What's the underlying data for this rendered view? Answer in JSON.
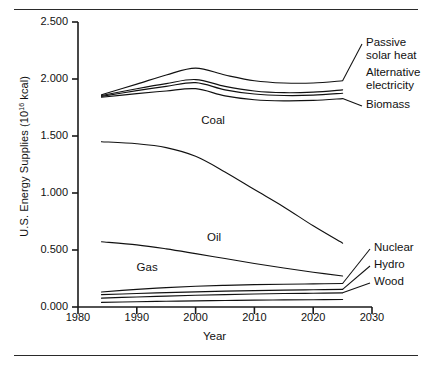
{
  "figure": {
    "has_top_rule": true,
    "has_bottom_rule": true
  },
  "chart_data": {
    "type": "line",
    "title": "",
    "xlabel": "Year",
    "ylabel": "U.S. Energy Supplies (10",
    "ylabel_exponent": "16",
    "ylabel_suffix": " kcal)",
    "xlim": [
      1980,
      2030
    ],
    "ylim": [
      0.0,
      2.5
    ],
    "grid": false,
    "legend_position": "inline-annotations",
    "x_ticks": [
      "1980",
      "1990",
      "2000",
      "2010",
      "2020",
      "2030"
    ],
    "x_tick_values": [
      1980,
      1990,
      2000,
      2010,
      2020,
      2030
    ],
    "y_ticks": [
      "0.000",
      "0.500",
      "1.000",
      "1.500",
      "2.000",
      "2.500"
    ],
    "y_tick_values": [
      0.0,
      0.5,
      1.0,
      1.5,
      2.0,
      2.5
    ],
    "x": [
      1984,
      1990,
      1995,
      2000,
      2005,
      2010,
      2015,
      2020,
      2025
    ],
    "series": [
      {
        "name": "Passive solar heat",
        "label": "Passive",
        "label_line2": "solar heat",
        "label_type": "leader",
        "values": [
          1.862,
          1.955,
          2.035,
          2.095,
          2.035,
          1.985,
          1.965,
          1.965,
          1.985
        ]
      },
      {
        "name": "Alternative electricity",
        "label": "Alternative",
        "label_line2": "electricity",
        "label_type": "leader",
        "values": [
          1.855,
          1.915,
          1.96,
          1.995,
          1.935,
          1.895,
          1.88,
          1.885,
          1.905
        ]
      },
      {
        "name": "Alternative electricity lower bound",
        "label": "",
        "label_type": "none",
        "values": [
          1.848,
          1.898,
          1.935,
          1.968,
          1.905,
          1.868,
          1.855,
          1.858,
          1.875
        ]
      },
      {
        "name": "Biomass",
        "label": "Biomass",
        "label_type": "leader",
        "values": [
          1.84,
          1.872,
          1.895,
          1.915,
          1.852,
          1.818,
          1.808,
          1.812,
          1.828
        ]
      },
      {
        "name": "Coal",
        "label": "Coal",
        "label_type": "inline",
        "values": [
          1.45,
          1.432,
          1.398,
          1.322,
          1.185,
          1.03,
          0.878,
          0.712,
          0.56
        ]
      },
      {
        "name": "Oil",
        "label": "Oil",
        "label_type": "inline",
        "values": [
          0.572,
          0.545,
          0.51,
          0.468,
          0.425,
          0.382,
          0.342,
          0.305,
          0.272
        ]
      },
      {
        "name": "Nuclear",
        "label": "Nuclear",
        "label_type": "leader",
        "values": [
          0.132,
          0.155,
          0.17,
          0.182,
          0.19,
          0.196,
          0.2,
          0.203,
          0.206
        ]
      },
      {
        "name": "Hydro",
        "label": "Hydro",
        "label_type": "leader",
        "values": [
          0.108,
          0.118,
          0.126,
          0.133,
          0.139,
          0.144,
          0.148,
          0.151,
          0.154
        ]
      },
      {
        "name": "Wood",
        "label": "Wood",
        "label_type": "leader",
        "values": [
          0.078,
          0.088,
          0.096,
          0.103,
          0.109,
          0.114,
          0.118,
          0.121,
          0.124
        ]
      },
      {
        "name": "Gas",
        "label": "Gas",
        "label_type": "inline",
        "values": [
          0.04,
          0.046,
          0.05,
          0.054,
          0.057,
          0.06,
          0.062,
          0.064,
          0.066
        ]
      }
    ],
    "annotations": [
      {
        "text": "Coal",
        "x": 2003,
        "y": 1.62
      },
      {
        "text": "Oil",
        "x": 2004,
        "y": 0.6
      },
      {
        "text": "Gas",
        "x": 1992,
        "y": 0.33
      }
    ]
  }
}
